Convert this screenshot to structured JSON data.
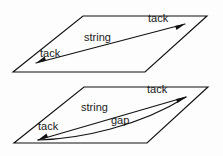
{
  "figure": {
    "background_color": "#fdfdfd",
    "line_color": "#111111",
    "text_color": "#1a1a1a",
    "width": 223,
    "height": 156
  },
  "panels": [
    {
      "id": "upper-panel",
      "name": "taut-string-plane",
      "labels": {
        "string": "string",
        "tack_left": "tack",
        "tack_right": "tack"
      }
    },
    {
      "id": "lower-panel",
      "name": "slack-string-plane",
      "labels": {
        "string": "string",
        "gap": "gap",
        "tack_left": "tack",
        "tack_right": "tack"
      }
    }
  ],
  "geometry": {
    "upper_plane": "M 83,16 L 207,16 L 145,72 L 13,72 Z",
    "upper_string": "M 36,63 L 185,24",
    "upper_tack_left_head": "M 36,63 L 46,60.5 L 44.5,56.5 Z",
    "upper_tack_right_head": "M 185,24 L 175,26 L 176.5,30 Z",
    "lower_plane": "M 84,87 L 208,87 L 147,143 L 14,143 Z",
    "lower_string": "M 38,140 L 186,97",
    "lower_gap_curve": "M 38,140 C 80,139 140,126 186,97",
    "lower_tack_left_head": "M 38,140 L 48,137.5 L 46.5,133.5 Z",
    "lower_tack_right_head": "M 186,97 L 176,99 L 177.5,103 Z"
  },
  "text_positions": {
    "upper_string": {
      "x": 84,
      "y": 41
    },
    "upper_tack_left": {
      "x": 40,
      "y": 57
    },
    "upper_tack_right": {
      "x": 148,
      "y": 22
    },
    "lower_string": {
      "x": 81,
      "y": 111
    },
    "lower_tack_left": {
      "x": 38,
      "y": 130
    },
    "lower_tack_right": {
      "x": 147,
      "y": 93
    },
    "lower_gap": {
      "x": 111,
      "y": 124
    }
  }
}
